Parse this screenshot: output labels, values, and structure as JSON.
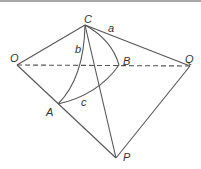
{
  "diagram": {
    "colors": {
      "line": "#555555",
      "label": "#333333",
      "topbar": "#a8a8a8"
    },
    "points": {
      "C": {
        "label": "C",
        "x": 85,
        "y": 25
      },
      "O": {
        "label": "O",
        "x": 17,
        "y": 65
      },
      "Q": {
        "label": "Q",
        "x": 190,
        "y": 66
      },
      "B": {
        "label": "B",
        "x": 119,
        "y": 65
      },
      "A": {
        "label": "A",
        "x": 58,
        "y": 104
      },
      "P": {
        "label": "P",
        "x": 116,
        "y": 158
      }
    },
    "arc_labels": {
      "a": "a",
      "b": "b",
      "c": "c"
    }
  }
}
